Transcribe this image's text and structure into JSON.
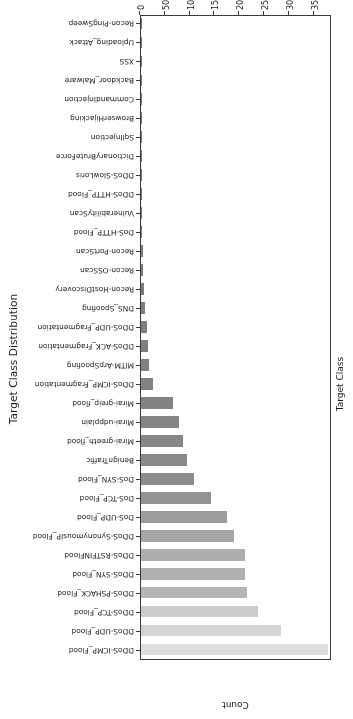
{
  "chart_data": {
    "type": "bar",
    "orientation": "horizontal",
    "title": "Target Class Distribution",
    "xlabel": "Count",
    "ylabel": "Target Class",
    "xlim": [
      0,
      38500
    ],
    "grid": false,
    "legend": null,
    "xticks": [
      0,
      5000,
      10000,
      15000,
      20000,
      25000,
      30000,
      35000
    ],
    "xticklabels": [
      "0",
      "5000",
      "10000",
      "15000",
      "20000",
      "25000",
      "30000",
      "35000"
    ],
    "categories": [
      "DDoS-ICMP_Flood",
      "DDoS-UDP_Flood",
      "DDoS-TCP_Flood",
      "DDoS-PSHACK_Flood",
      "DDoS-SYN_Flood",
      "DDoS-RSTFINFlood",
      "DDoS-SynonymousIP_Flood",
      "DoS-UDP_Flood",
      "DoS-TCP_Flood",
      "DoS-SYN_Flood",
      "BenignTraffic",
      "Mirai-greeth_flood",
      "Mirai-udpplain",
      "Mirai-greip_flood",
      "DDoS-ICMP_Fragmentation",
      "MITM-ArpSpoofing",
      "DDoS-ACK_Fragmentation",
      "DDoS-UDP_Fragmentation",
      "DNS_Spoofing",
      "Recon-HostDiscovery",
      "Recon-OSScan",
      "Recon-PortScan",
      "DoS-HTTP_Flood",
      "VulnerabilityScan",
      "DDoS-HTTP_Flood",
      "DDoS-SlowLoris",
      "DictionaryBruteForce",
      "SqlInjection",
      "BrowserHijacking",
      "CommandInjection",
      "Backdoor_Malware",
      "XSS",
      "Uploading_Attack",
      "Recon-PingSweep"
    ],
    "values": [
      37600,
      28300,
      23600,
      21400,
      21000,
      20900,
      18700,
      17300,
      14100,
      10600,
      9200,
      8500,
      7700,
      6400,
      2400,
      1600,
      1400,
      1300,
      900,
      650,
      480,
      400,
      290,
      220,
      180,
      140,
      90,
      60,
      50,
      45,
      40,
      30,
      25,
      20
    ],
    "bar_colors": [
      "#dedede",
      "#d4d4d4",
      "#cbcbcb",
      "#b5b5b5",
      "#b0b0b0",
      "#aeaeae",
      "#a4a4a4",
      "#9c9c9c",
      "#929292",
      "#8c8c8c",
      "#898989",
      "#878787",
      "#858585",
      "#838383",
      "#818181",
      "#808080",
      "#7f7f7f",
      "#7f7f7f",
      "#7e7e7e",
      "#7d7d7d",
      "#7d7d7d",
      "#7c7c7c",
      "#7c7c7c",
      "#7b7b7b",
      "#7b7b7b",
      "#7a7a7a",
      "#7a7a7a",
      "#797979",
      "#797979",
      "#787878",
      "#787878",
      "#777777",
      "#777777",
      "#767676"
    ]
  }
}
